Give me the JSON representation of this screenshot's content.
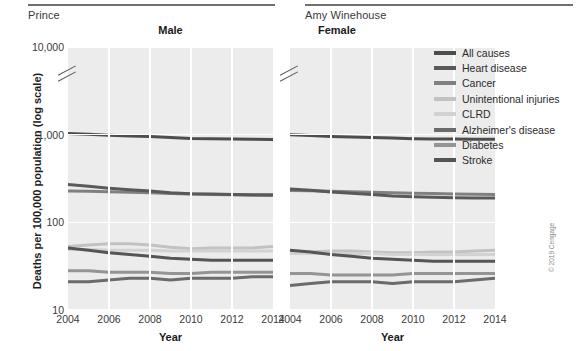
{
  "captions": {
    "left_name": "Prince",
    "right_name": "Amy Winehouse"
  },
  "axes": {
    "y_title": "Deaths per 100,000 population (log scale)",
    "x_title": "Year",
    "y_ticks": [
      "10,000",
      "1,000",
      "100",
      "10"
    ],
    "x_ticks": [
      "2004",
      "2006",
      "2008",
      "2010",
      "2012",
      "2014"
    ]
  },
  "panels": [
    {
      "key": "male",
      "title": "Male"
    },
    {
      "key": "female",
      "title": "Female"
    }
  ],
  "legend": {
    "items": [
      {
        "label": "All causes",
        "color": "#4d4d4d"
      },
      {
        "label": "Heart disease",
        "color": "#595959"
      },
      {
        "label": "Cancer",
        "color": "#808080"
      },
      {
        "label": "Unintentional injuries",
        "color": "#c2c2c2"
      },
      {
        "label": "CLRD",
        "color": "#d2d2d2"
      },
      {
        "label": "Alzheimer's disease",
        "color": "#6b6b6b"
      },
      {
        "label": "Diabetes",
        "color": "#949494"
      },
      {
        "label": "Stroke",
        "color": "#555555"
      }
    ]
  },
  "copyright": "© 2019 Cengage",
  "chart_data": {
    "type": "line",
    "title": "",
    "xlabel": "Year",
    "ylabel": "Deaths per 100,000 population (log scale)",
    "log_scale": true,
    "ylim": [
      10,
      10000
    ],
    "y_tick_values": [
      10,
      100,
      1000,
      10000
    ],
    "x": [
      2004,
      2005,
      2006,
      2007,
      2008,
      2009,
      2010,
      2011,
      2012,
      2013,
      2014
    ],
    "xlim": [
      2004,
      2014
    ],
    "grid": "white gridlines on gray panel, vertical at even years, horizontal at decades",
    "legend_position": "right",
    "panels": [
      {
        "name": "Male",
        "series": [
          {
            "name": "All causes",
            "color": "#4d4d4d",
            "values": [
              1030,
              1010,
              985,
              965,
              955,
              930,
              905,
              900,
              890,
              885,
              880
            ]
          },
          {
            "name": "Heart disease",
            "color": "#595959",
            "values": [
              270,
              258,
              245,
              235,
              228,
              218,
              212,
              210,
              208,
              207,
              206
            ]
          },
          {
            "name": "Cancer",
            "color": "#808080",
            "values": [
              228,
              226,
              223,
              220,
              217,
              213,
              210,
              208,
              206,
              204,
              202
            ]
          },
          {
            "name": "Unintentional injuries",
            "color": "#c2c2c2",
            "values": [
              53,
              55,
              57,
              57,
              55,
              52,
              50,
              51,
              51,
              51,
              53
            ]
          },
          {
            "name": "CLRD",
            "color": "#d2d2d2",
            "values": [
              49,
              49,
              48,
              48,
              48,
              47,
              47,
              47,
              47,
              47,
              47
            ]
          },
          {
            "name": "Alzheimer's disease",
            "color": "#6b6b6b",
            "values": [
              21,
              21,
              22,
              23,
              23,
              22,
              23,
              23,
              23,
              24,
              24
            ]
          },
          {
            "name": "Diabetes",
            "color": "#949494",
            "values": [
              28,
              28,
              27,
              27,
              27,
              26,
              26,
              27,
              27,
              27,
              27
            ]
          },
          {
            "name": "Stroke",
            "color": "#555555",
            "values": [
              51,
              48,
              45,
              43,
              41,
              39,
              38,
              37,
              37,
              37,
              37
            ]
          }
        ]
      },
      {
        "name": "Female",
        "series": [
          {
            "name": "All causes",
            "color": "#4d4d4d",
            "values": [
              1000,
              980,
              955,
              940,
              930,
              915,
              900,
              895,
              890,
              885,
              885
            ]
          },
          {
            "name": "Heart disease",
            "color": "#595959",
            "values": [
              240,
              232,
              222,
              215,
              208,
              200,
              196,
              193,
              191,
              190,
              189
            ]
          },
          {
            "name": "Cancer",
            "color": "#808080",
            "values": [
              231,
              229,
              226,
              224,
              221,
              218,
              215,
              213,
              211,
              209,
              208
            ]
          },
          {
            "name": "Unintentional injuries",
            "color": "#c2c2c2",
            "values": [
              45,
              46,
              47,
              47,
              46,
              45,
              45,
              46,
              46,
              47,
              48
            ]
          },
          {
            "name": "CLRD",
            "color": "#d2d2d2",
            "values": [
              44,
              44,
              44,
              44,
              44,
              43,
              43,
              43,
              43,
              43,
              43
            ]
          },
          {
            "name": "Alzheimer's disease",
            "color": "#6b6b6b",
            "values": [
              19,
              20,
              21,
              21,
              21,
              20,
              21,
              21,
              21,
              22,
              23
            ]
          },
          {
            "name": "Diabetes",
            "color": "#949494",
            "values": [
              26,
              26,
              25,
              25,
              25,
              25,
              26,
              26,
              26,
              26,
              26
            ]
          },
          {
            "name": "Stroke",
            "color": "#555555",
            "values": [
              48,
              46,
              43,
              41,
              39,
              38,
              37,
              36,
              36,
              36,
              36
            ]
          }
        ]
      }
    ]
  }
}
